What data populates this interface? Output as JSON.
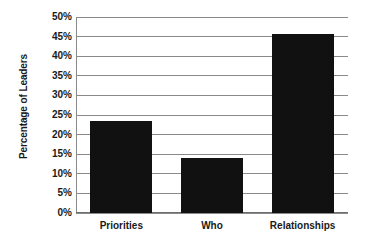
{
  "chart_data": {
    "type": "bar",
    "title": "",
    "xlabel": "",
    "ylabel": "Percentage of Leaders",
    "categories": [
      "Priorities",
      "Who",
      "Relationships"
    ],
    "values": [
      23.5,
      14.0,
      45.7
    ],
    "ylim": [
      0,
      50
    ],
    "ytick_values": [
      0,
      5,
      10,
      15,
      20,
      25,
      30,
      35,
      40,
      45,
      50
    ],
    "ytick_labels": [
      "0%",
      "5%",
      "10%",
      "15%",
      "20%",
      "25%",
      "30%",
      "35%",
      "40%",
      "45%",
      "50%"
    ],
    "grid": true,
    "grid_axis": "y",
    "legend": false,
    "legend_position": "none",
    "bar_color": "#111111",
    "grid_color": "#8a8a8a",
    "axis_color": "#6e6e6e",
    "background_color": "#ffffff",
    "text_color": "#1a1a1a"
  }
}
